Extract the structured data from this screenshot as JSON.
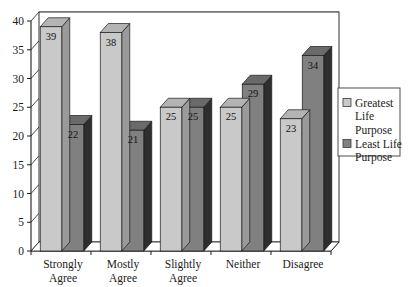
{
  "chart_data": {
    "type": "bar",
    "title": "",
    "subtitle": "",
    "xlabel": "",
    "ylabel": "",
    "categories": [
      "Strongly Agree",
      "Mostly Agree",
      "Slightly Agree",
      "Neither",
      "Disagree"
    ],
    "category_lines": [
      [
        "Strongly",
        "Agree"
      ],
      [
        "Mostly",
        "Agree"
      ],
      [
        "Slightly",
        "Agree"
      ],
      [
        "Neither"
      ],
      [
        "Disagree"
      ]
    ],
    "series": [
      {
        "name": "Greatest Life Purpose",
        "name_lines": [
          "Greatest",
          "Life",
          "Purpose"
        ],
        "color": "#c9c9c9",
        "values": [
          39,
          38,
          25,
          25,
          23
        ]
      },
      {
        "name": "Least Life Purpose",
        "name_lines": [
          "Least Life",
          "Purpose"
        ],
        "color": "#808080",
        "values": [
          22,
          21,
          25,
          29,
          34
        ]
      }
    ],
    "ylim": [
      0,
      40
    ],
    "ytick_values": [
      0,
      5,
      10,
      15,
      20,
      25,
      30,
      35,
      40
    ],
    "ytick_labels": [
      "0",
      "5",
      "10",
      "15",
      "20",
      "25",
      "30",
      "35",
      "40"
    ],
    "grid": true,
    "grid_axis": "y",
    "legend_position": "right",
    "style": "3d-grouped-bar",
    "data_labels_shown": true
  },
  "legend": {
    "entries": [
      {
        "label": "Greatest Life Purpose",
        "swatch_color": "#c9c9c9"
      },
      {
        "label": "Least Life Purpose",
        "swatch_color": "#808080"
      }
    ]
  },
  "colors": {
    "series_light": "#c9c9c9",
    "series_dark": "#808080",
    "axis_line": "#1a1a1a",
    "grid_line": "#6e6e6e",
    "background": "#ffffff",
    "bar_top_light": "#b4b4b4",
    "bar_side_light": "#9a9a9a",
    "bar_top_dark": "#6a6a6a",
    "bar_side_dark": "#2e2e2e"
  }
}
